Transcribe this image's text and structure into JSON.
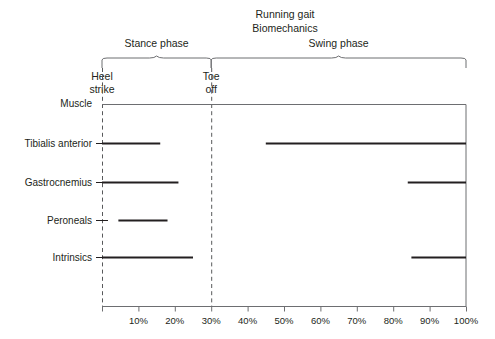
{
  "figure": {
    "title_line1": "Running gait",
    "title_line2": "Biomechanics",
    "row_header": "Muscle"
  },
  "phases": [
    {
      "label": "Stance phase",
      "start_pct": 0,
      "end_pct": 30
    },
    {
      "label": "Swing phase",
      "start_pct": 30,
      "end_pct": 100
    }
  ],
  "events": [
    {
      "label_line1": "Heel",
      "label_line2": "strike",
      "pct": 0
    },
    {
      "label_line1": "Toe",
      "label_line2": "off",
      "pct": 30
    }
  ],
  "axis": {
    "ticks": [
      "10%",
      "20%",
      "30%",
      "40%",
      "50%",
      "60%",
      "70%",
      "80%",
      "90%",
      "100%"
    ],
    "tick_values": [
      10,
      20,
      30,
      40,
      50,
      60,
      70,
      80,
      90,
      100
    ],
    "min": 0,
    "max": 100
  },
  "chart_data": {
    "type": "bar",
    "title": "Running gait Biomechanics",
    "xlabel": "",
    "ylabel": "Muscle",
    "xlim": [
      0,
      100
    ],
    "grid": false,
    "legend": false,
    "orientation": "horizontal",
    "note": "Horizontal activity-period (EMG on/off) chart of running gait cycle; each muscle may have multiple active intervals expressed in percent of gait cycle.",
    "categories": [
      "Tibialis anterior",
      "Gastrocnemius",
      "Peroneals",
      "Intrinsics"
    ],
    "series": [
      {
        "name": "Tibialis anterior",
        "intervals": [
          [
            0,
            16
          ],
          [
            45,
            100
          ]
        ]
      },
      {
        "name": "Gastrocnemius",
        "intervals": [
          [
            0,
            21
          ],
          [
            84,
            100
          ]
        ]
      },
      {
        "name": "Peroneals",
        "intervals": [
          [
            4.5,
            18
          ]
        ]
      },
      {
        "name": "Intrinsics",
        "intervals": [
          [
            0,
            25
          ],
          [
            85,
            100
          ]
        ]
      }
    ]
  },
  "colors": {
    "bar": "#231f20",
    "axis": "#6d6e71",
    "dashed": "#58595b",
    "background": "#ffffff"
  }
}
